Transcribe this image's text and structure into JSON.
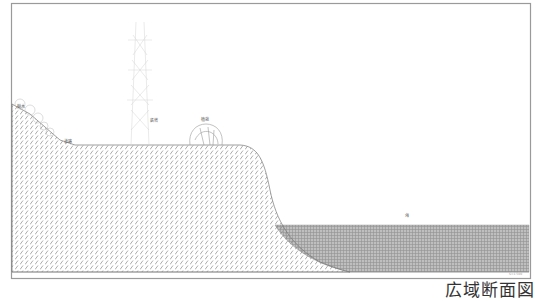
{
  "title": "広域断面図",
  "labels": {
    "slope_vegetation": "樹木",
    "path": "道路",
    "tower": "鉄塔",
    "shrub": "植栽",
    "water": "海"
  },
  "scale_note": "S=1:500",
  "colors": {
    "frame": "#9a9a9a",
    "ground_hatch": "#8a8a8a",
    "water_fill": "#b5b5b5",
    "outline": "#777777",
    "background": "#ffffff"
  }
}
